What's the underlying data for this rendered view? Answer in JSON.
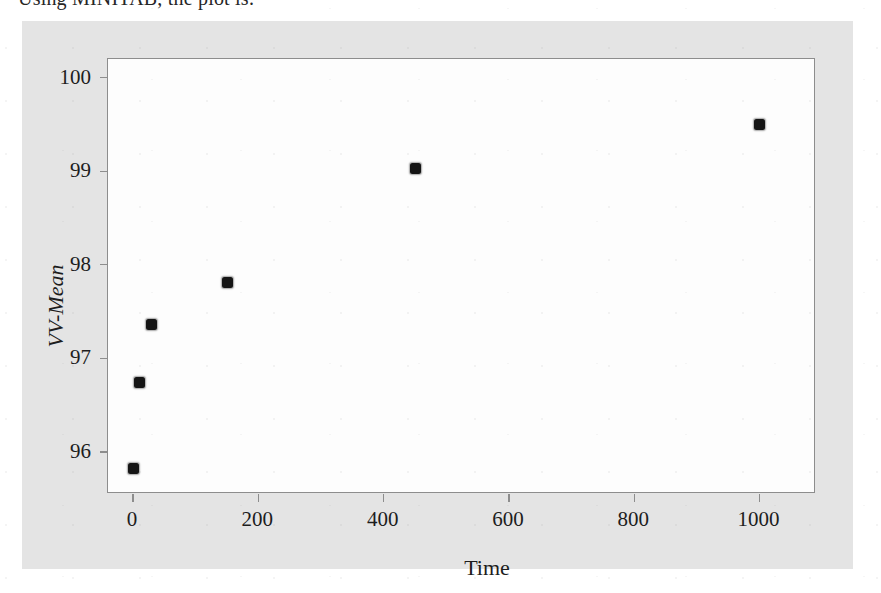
{
  "caption": {
    "text": "Using MINITAB, the plot is:"
  },
  "figure": {
    "panel_bg": "#e4e4e4",
    "plot_bg": "#fdfdfd",
    "frame_color": "#8d8d8d",
    "marker_color": "#151515"
  },
  "chart_data": {
    "type": "scatter",
    "title": "",
    "xlabel": "Time",
    "ylabel": "VV-Mean",
    "xlim": [
      -40,
      1090
    ],
    "ylim": [
      95.55,
      100.2
    ],
    "xticks": [
      0,
      200,
      400,
      600,
      800,
      1000
    ],
    "xtick_labels": [
      "0",
      "200",
      "400",
      "600",
      "800",
      "1000"
    ],
    "yticks": [
      96,
      97,
      98,
      99,
      100
    ],
    "ytick_labels": [
      "96",
      "97",
      "98",
      "99",
      "100"
    ],
    "grid": false,
    "legend": false,
    "series": [
      {
        "name": "VV-Mean vs Time",
        "marker": "filled-square-round",
        "points": [
          {
            "x": 0,
            "y": 95.82
          },
          {
            "x": 10,
            "y": 96.74
          },
          {
            "x": 30,
            "y": 97.36
          },
          {
            "x": 150,
            "y": 97.81
          },
          {
            "x": 450,
            "y": 99.03
          },
          {
            "x": 1000,
            "y": 99.5
          }
        ]
      }
    ]
  }
}
